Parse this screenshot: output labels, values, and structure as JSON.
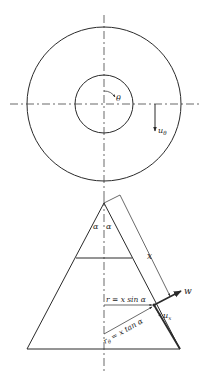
{
  "figure": {
    "top_view": {
      "theta_label": "θ",
      "u_theta_label": "u",
      "u_theta_sub": "θ"
    },
    "side_view": {
      "alpha_left": "α",
      "alpha_right": "α",
      "x_label": "x",
      "w_label": "w",
      "r_label": "r = x sin α",
      "r_theta_main": "r",
      "r_theta_sub": "θ",
      "r_theta_rest": " = x tan α",
      "u_x_label": "u",
      "u_x_sub": "x"
    }
  }
}
